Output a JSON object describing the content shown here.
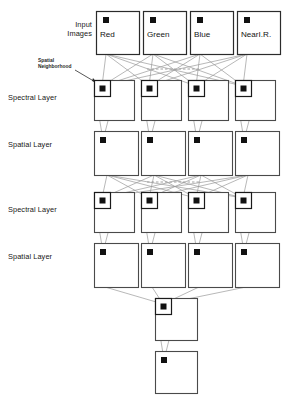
{
  "figure": {
    "type": "neural-network-architecture-diagram",
    "title": ""
  },
  "labels": {
    "input_images": "Input\nImages",
    "input_images_line1": "Input",
    "input_images_line2": "Images",
    "spatial_neighborhood_line1": "Spatial",
    "spatial_neighborhood_line2": "Neighborhood",
    "spectral_layer_1": "Spectral Layer",
    "spatial_layer_1": "Spatial Layer",
    "spectral_layer_2": "Spectral Layer",
    "spatial_layer_2": "Spatial Layer"
  },
  "input_bands": [
    {
      "name": "Red",
      "x": 96,
      "y": 11,
      "w": 43,
      "h": 43
    },
    {
      "name": "Green",
      "x": 143,
      "y": 11,
      "w": 43,
      "h": 43
    },
    {
      "name": "Blue",
      "x": 190,
      "y": 11,
      "w": 43,
      "h": 43
    },
    {
      "name": "NearI.R.",
      "x": 237,
      "y": 11,
      "w": 43,
      "h": 43
    }
  ],
  "rows": [
    {
      "id": "spectral-layer-1",
      "label": "Spectral Layer",
      "kind": "spectral",
      "label_x": 8,
      "label_y": 93,
      "boxes": [
        {
          "x": 94,
          "y": 80,
          "w": 40,
          "h": 40
        },
        {
          "x": 141,
          "y": 80,
          "w": 40,
          "h": 40
        },
        {
          "x": 188,
          "y": 80,
          "w": 40,
          "h": 40
        },
        {
          "x": 235,
          "y": 80,
          "w": 40,
          "h": 40
        }
      ]
    },
    {
      "id": "spatial-layer-1",
      "label": "Spatial Layer",
      "kind": "spatial",
      "label_x": 8,
      "label_y": 140,
      "boxes": [
        {
          "x": 94,
          "y": 131,
          "w": 44,
          "h": 44
        },
        {
          "x": 141,
          "y": 131,
          "w": 44,
          "h": 44
        },
        {
          "x": 188,
          "y": 131,
          "w": 44,
          "h": 44
        },
        {
          "x": 235,
          "y": 131,
          "w": 44,
          "h": 44
        }
      ]
    },
    {
      "id": "spectral-layer-2",
      "label": "Spectral Layer",
      "kind": "spectral",
      "label_x": 8,
      "label_y": 205,
      "boxes": [
        {
          "x": 94,
          "y": 192,
          "w": 40,
          "h": 40
        },
        {
          "x": 141,
          "y": 192,
          "w": 40,
          "h": 40
        },
        {
          "x": 188,
          "y": 192,
          "w": 40,
          "h": 40
        },
        {
          "x": 235,
          "y": 192,
          "w": 40,
          "h": 40
        }
      ]
    },
    {
      "id": "spatial-layer-2",
      "label": "Spatial Layer",
      "kind": "spatial",
      "label_x": 8,
      "label_y": 252,
      "boxes": [
        {
          "x": 94,
          "y": 243,
          "w": 44,
          "h": 44
        },
        {
          "x": 141,
          "y": 243,
          "w": 44,
          "h": 44
        },
        {
          "x": 188,
          "y": 243,
          "w": 44,
          "h": 44
        },
        {
          "x": 235,
          "y": 243,
          "w": 44,
          "h": 44
        }
      ]
    },
    {
      "id": "output-spectral-layer",
      "label": "",
      "kind": "spectral",
      "label_x": 0,
      "label_y": 0,
      "boxes": [
        {
          "x": 155,
          "y": 298,
          "w": 42,
          "h": 42
        }
      ]
    },
    {
      "id": "output-spatial-layer",
      "label": "",
      "kind": "spatial",
      "label_x": 0,
      "label_y": 0,
      "boxes": [
        {
          "x": 155,
          "y": 351,
          "w": 42,
          "h": 42
        }
      ]
    }
  ],
  "separators": [
    {
      "id": "dashed-separator-top",
      "x1": 147,
      "x2": 200,
      "y": 69
    },
    {
      "id": "dashed-separator-mid",
      "x1": 147,
      "x2": 200,
      "y": 182
    }
  ],
  "colors": {
    "box_stroke": "#4a4a4a",
    "inner_box_stroke": "#1a1a1a",
    "marker_fill": "#111111",
    "edge_stroke": "#9a9a9a",
    "dashed_stroke": "#8a8a8a",
    "background": "#ffffff",
    "text": "#171717"
  },
  "geometry": {
    "marker_size": 6,
    "inner_box_size": 16,
    "width": 291,
    "height": 397
  }
}
